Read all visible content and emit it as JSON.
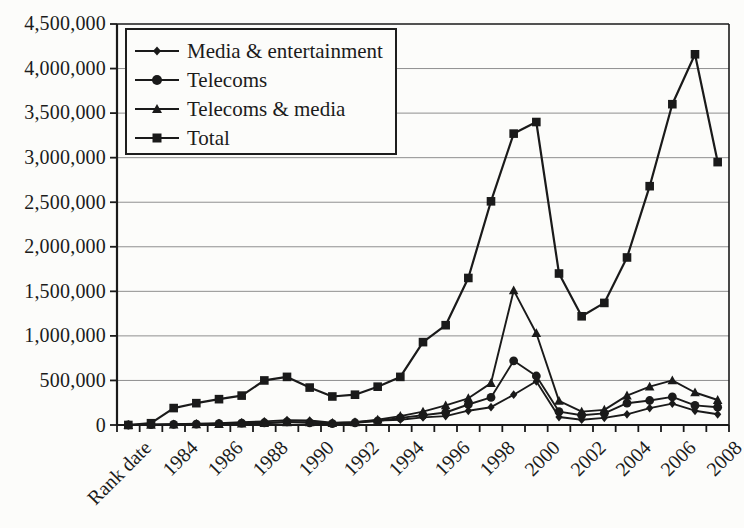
{
  "figure": {
    "background": "#fcfcfa",
    "text_color": "#1b1b1b",
    "line_color": "#1a1a1a",
    "gridline_color": "#8f8f8f"
  },
  "chart_data": {
    "type": "line",
    "title": "",
    "xlabel": "",
    "ylabel": "",
    "ylim": [
      0,
      4500000
    ],
    "y_tick_interval": 500000,
    "grid": "horizontal",
    "legend_position": "top-left-inside",
    "categories": [
      "Rank date",
      "1983",
      "1984",
      "1985",
      "1986",
      "1987",
      "1988",
      "1989",
      "1990",
      "1991",
      "1992",
      "1993",
      "1994",
      "1995",
      "1996",
      "1997",
      "1998",
      "1999",
      "2000",
      "2001",
      "2002",
      "2003",
      "2004",
      "2005",
      "2006",
      "2007",
      "2008"
    ],
    "x_tick_labels": [
      "Rank date",
      "1984",
      "1986",
      "1988",
      "1990",
      "1992",
      "1994",
      "1996",
      "1998",
      "2000",
      "2002",
      "2004",
      "2006",
      "2008"
    ],
    "y_tick_labels": [
      "4,500,000",
      "4,000,000",
      "3,500,000",
      "3,000,000",
      "2,500,000",
      "2,000,000",
      "1,500,000",
      "1,000,000",
      "500,000",
      "0"
    ],
    "series": [
      {
        "name": "Media & entertainment",
        "marker": "diamond",
        "values": [
          0,
          5000,
          10000,
          15000,
          20000,
          30000,
          40000,
          55000,
          50000,
          25000,
          30000,
          50000,
          60000,
          85000,
          100000,
          160000,
          200000,
          340000,
          490000,
          90000,
          60000,
          80000,
          120000,
          190000,
          240000,
          160000,
          120000
        ]
      },
      {
        "name": "Telecoms",
        "marker": "circle",
        "values": [
          0,
          5000,
          8000,
          10000,
          15000,
          20000,
          25000,
          35000,
          25000,
          15000,
          25000,
          45000,
          80000,
          110000,
          140000,
          230000,
          310000,
          720000,
          550000,
          150000,
          110000,
          130000,
          245000,
          275000,
          315000,
          220000,
          200000
        ]
      },
      {
        "name": "Telecoms & media",
        "marker": "triangle",
        "values": [
          0,
          2000,
          5000,
          8000,
          10000,
          15000,
          20000,
          30000,
          30000,
          20000,
          30000,
          60000,
          100000,
          150000,
          220000,
          300000,
          470000,
          1510000,
          1030000,
          270000,
          150000,
          170000,
          330000,
          430000,
          500000,
          365000,
          280000
        ]
      },
      {
        "name": "Total",
        "marker": "square",
        "values": [
          0,
          20000,
          190000,
          245000,
          290000,
          330000,
          500000,
          540000,
          420000,
          320000,
          340000,
          430000,
          540000,
          930000,
          1120000,
          1650000,
          2510000,
          3270000,
          3400000,
          1700000,
          1220000,
          1370000,
          1880000,
          2680000,
          3600000,
          4160000,
          2950000
        ]
      }
    ]
  }
}
